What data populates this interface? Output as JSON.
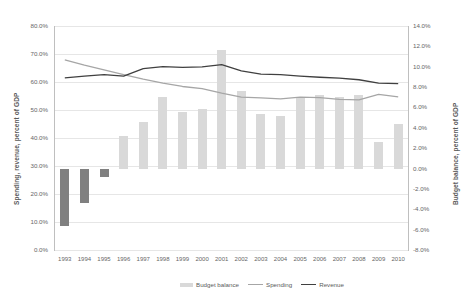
{
  "chart_data": {
    "type": "bar",
    "title": "",
    "xlabel": "",
    "ylabel": "Spending, revenue, percent of GDP",
    "y2label": "Budget balance, percent of GDP",
    "grid": true,
    "legend_position": "bottom",
    "categories": [
      "1993",
      "1994",
      "1995",
      "1996",
      "1997",
      "1998",
      "1999",
      "2000",
      "2001",
      "2002",
      "2003",
      "2004",
      "2005",
      "2006",
      "2007",
      "2008",
      "2009",
      "2010"
    ],
    "ylim": [
      0.0,
      80.0
    ],
    "y2lim": [
      -8.0,
      14.0
    ],
    "yticks": [
      "0.0%",
      "10.0%",
      "20.0%",
      "30.0%",
      "40.0%",
      "50.0%",
      "60.0%",
      "70.0%",
      "80.0%"
    ],
    "y2ticks": [
      "-8.0%",
      "-6.0%",
      "-4.0%",
      "-2.0%",
      "0.0%",
      "2.0%",
      "4.0%",
      "6.0%",
      "8.0%",
      "10.0%",
      "12.0%",
      "14.0%"
    ],
    "series": [
      {
        "name": "Budget balance",
        "type": "bar",
        "axis": "right",
        "color": "#d9d9d9",
        "negative_color": "#808080",
        "values": [
          -5.6,
          -3.4,
          -0.8,
          3.2,
          4.6,
          7.0,
          5.6,
          5.8,
          11.6,
          7.6,
          5.4,
          5.2,
          7.0,
          7.2,
          7.0,
          7.2,
          2.6,
          4.4
        ]
      },
      {
        "name": "Spending",
        "type": "line",
        "axis": "left",
        "color": "#a6a6a6",
        "values": [
          67.9,
          66.0,
          64.3,
          62.6,
          61.0,
          59.6,
          58.4,
          57.6,
          56.0,
          54.6,
          54.3,
          54.0,
          54.6,
          54.4,
          53.8,
          53.6,
          55.6,
          54.7
        ]
      },
      {
        "name": "Revenue",
        "type": "line",
        "axis": "left",
        "color": "#404040",
        "values": [
          61.5,
          62.1,
          62.6,
          62.1,
          64.8,
          65.5,
          65.2,
          65.4,
          66.2,
          64.0,
          62.8,
          62.6,
          62.1,
          61.7,
          61.4,
          60.8,
          59.6,
          59.4
        ]
      }
    ]
  },
  "legend": {
    "items": [
      {
        "label": "Budget balance",
        "marker": "bar-swatch"
      },
      {
        "label": "Spending",
        "marker": "line-swatch"
      },
      {
        "label": "Revenue",
        "marker": "line-swatch"
      }
    ]
  }
}
